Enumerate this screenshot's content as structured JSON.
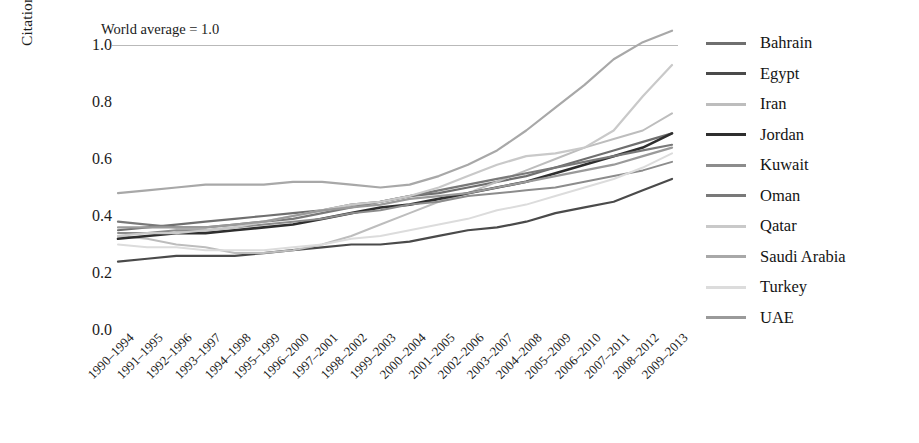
{
  "chart_data": {
    "type": "line",
    "title": "",
    "annotation": "World average = 1.0",
    "xlabel": "",
    "ylabel": "Citation impact relative to world",
    "ylim": [
      0.0,
      1.0
    ],
    "yticks": [
      "0.0",
      "0.2",
      "0.4",
      "0.6",
      "0.8",
      "1.0"
    ],
    "ytick_values": [
      0.0,
      0.2,
      0.4,
      0.6,
      0.8,
      1.0
    ],
    "grid": false,
    "legend_position": "right",
    "reference_line": {
      "label": "World average = 1.0",
      "value": 1.0,
      "color": "#b9b9b9"
    },
    "categories": [
      "1990–1994",
      "1991–1995",
      "1992–1996",
      "1993–1997",
      "1994–1998",
      "1995–1999",
      "1996–2000",
      "1997–2001",
      "1998–2002",
      "1999–2003",
      "2000–2004",
      "2001–2005",
      "2002–2006",
      "2003–2007",
      "2004–2008",
      "2005–2009",
      "2006–2010",
      "2007–2011",
      "2008–2012",
      "2009–2013"
    ],
    "series": [
      {
        "name": "Bahrain",
        "color": "#6f6f6f",
        "width": 2.2,
        "values": [
          0.35,
          0.36,
          0.37,
          0.38,
          0.39,
          0.4,
          0.41,
          0.42,
          0.44,
          0.45,
          0.47,
          0.48,
          0.5,
          0.52,
          0.54,
          0.57,
          0.6,
          0.63,
          0.66,
          0.69
        ]
      },
      {
        "name": "Egypt",
        "color": "#4a4a4a",
        "width": 2.2,
        "values": [
          0.24,
          0.25,
          0.26,
          0.26,
          0.26,
          0.27,
          0.28,
          0.29,
          0.3,
          0.3,
          0.31,
          0.33,
          0.35,
          0.36,
          0.38,
          0.41,
          0.43,
          0.45,
          0.49,
          0.53
        ]
      },
      {
        "name": "Iran",
        "color": "#bdbdbd",
        "width": 2.0,
        "values": [
          0.33,
          0.32,
          0.3,
          0.29,
          0.27,
          0.27,
          0.28,
          0.3,
          0.33,
          0.37,
          0.41,
          0.45,
          0.48,
          0.52,
          0.56,
          0.6,
          0.64,
          0.67,
          0.7,
          0.76
        ]
      },
      {
        "name": "Jordan",
        "color": "#2e2e2e",
        "width": 2.6,
        "values": [
          0.32,
          0.33,
          0.34,
          0.34,
          0.35,
          0.36,
          0.37,
          0.39,
          0.41,
          0.43,
          0.44,
          0.46,
          0.48,
          0.5,
          0.52,
          0.55,
          0.58,
          0.61,
          0.64,
          0.69
        ]
      },
      {
        "name": "Kuwait",
        "color": "#8c8c8c",
        "width": 2.0,
        "values": [
          0.34,
          0.34,
          0.35,
          0.35,
          0.36,
          0.37,
          0.38,
          0.39,
          0.41,
          0.42,
          0.44,
          0.45,
          0.47,
          0.48,
          0.49,
          0.5,
          0.52,
          0.54,
          0.56,
          0.59
        ]
      },
      {
        "name": "Oman",
        "color": "#797979",
        "width": 2.2,
        "values": [
          0.38,
          0.37,
          0.36,
          0.36,
          0.37,
          0.38,
          0.39,
          0.41,
          0.43,
          0.45,
          0.47,
          0.49,
          0.51,
          0.53,
          0.55,
          0.57,
          0.59,
          0.61,
          0.63,
          0.65
        ]
      },
      {
        "name": "Qatar",
        "color": "#c9c9c9",
        "width": 2.2,
        "values": [
          0.33,
          0.34,
          0.34,
          0.35,
          0.36,
          0.38,
          0.4,
          0.42,
          0.44,
          0.45,
          0.47,
          0.5,
          0.54,
          0.58,
          0.61,
          0.62,
          0.64,
          0.7,
          0.82,
          0.93
        ]
      },
      {
        "name": "Saudi Arabia",
        "color": "#a8a8a8",
        "width": 2.2,
        "values": [
          0.48,
          0.49,
          0.5,
          0.51,
          0.51,
          0.51,
          0.52,
          0.52,
          0.51,
          0.5,
          0.51,
          0.54,
          0.58,
          0.63,
          0.7,
          0.78,
          0.86,
          0.95,
          1.01,
          1.05
        ]
      },
      {
        "name": "Turkey",
        "color": "#dcdcdc",
        "width": 2.0,
        "values": [
          0.3,
          0.29,
          0.29,
          0.28,
          0.28,
          0.28,
          0.29,
          0.3,
          0.32,
          0.33,
          0.35,
          0.37,
          0.39,
          0.42,
          0.44,
          0.47,
          0.5,
          0.53,
          0.57,
          0.62
        ]
      },
      {
        "name": "UAE",
        "color": "#9a9a9a",
        "width": 2.2,
        "values": [
          0.36,
          0.36,
          0.36,
          0.36,
          0.37,
          0.38,
          0.4,
          0.42,
          0.43,
          0.44,
          0.46,
          0.47,
          0.48,
          0.5,
          0.52,
          0.54,
          0.56,
          0.58,
          0.61,
          0.64
        ]
      }
    ]
  }
}
